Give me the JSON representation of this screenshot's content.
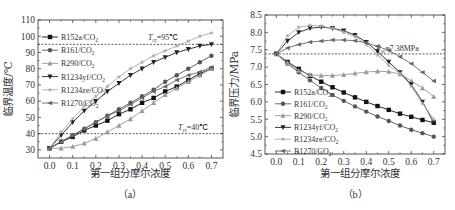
{
  "chart_data": [
    {
      "id": "a",
      "type": "line",
      "caption": "（a）",
      "title": "",
      "xlabel": "第一组分摩尔浓度",
      "ylabel": "临界温度/℃",
      "xlim": [
        -0.05,
        0.75
      ],
      "ylim": [
        25,
        110
      ],
      "xticks": [
        "0.0",
        "0.1",
        "0.2",
        "0.3",
        "0.4",
        "0.5",
        "0.6",
        "0.7"
      ],
      "yticks": [
        "30",
        "40",
        "50",
        "60",
        "70",
        "80",
        "90",
        "100",
        "110"
      ],
      "grid": false,
      "legend_position": "upper left",
      "annotations": [
        {
          "text_main": "T",
          "text_sub": "cr",
          "text_rest": "=95℃",
          "y": 95,
          "dashed_line": true
        },
        {
          "text_main": "T",
          "text_sub": "cr",
          "text_rest": "=40℃",
          "y": 40,
          "dashed_line": true
        }
      ],
      "x": [
        0.0,
        0.05,
        0.1,
        0.15,
        0.2,
        0.25,
        0.3,
        0.35,
        0.4,
        0.45,
        0.5,
        0.55,
        0.6,
        0.65,
        0.7
      ],
      "series": [
        {
          "name": "R152a/CO",
          "sub": "2",
          "marker": "square",
          "color": "#111111",
          "values": [
            31,
            35,
            38,
            42,
            45,
            48,
            52,
            55,
            59,
            62,
            66,
            69,
            73,
            77,
            80
          ]
        },
        {
          "name": "R161/CO",
          "sub": "2",
          "marker": "circle",
          "color": "#555555",
          "values": [
            31,
            35,
            39,
            43,
            47,
            51,
            55,
            59,
            63,
            67,
            72,
            76,
            80,
            84,
            88
          ]
        },
        {
          "name": "R290/CO",
          "sub": "2",
          "marker": "triangle-up",
          "color": "#999999",
          "values": [
            31,
            31,
            32,
            34,
            37,
            41,
            45,
            49,
            54,
            59,
            64,
            68,
            72,
            76,
            80
          ]
        },
        {
          "name": "R1234yf/CO",
          "sub": "2",
          "marker": "triangle-down",
          "color": "#222222",
          "values": [
            31,
            39,
            47,
            54,
            60,
            66,
            71,
            76,
            80,
            84,
            87,
            90,
            92,
            94,
            95
          ]
        },
        {
          "name": "R1234ze/CO",
          "sub": "2",
          "marker": "star",
          "color": "#aaaaaa",
          "values": [
            31,
            41,
            49,
            57,
            63,
            69,
            75,
            80,
            84,
            88,
            91,
            94,
            97,
            100,
            102
          ]
        },
        {
          "name": "R1270/CO",
          "sub": "2",
          "marker": "left-triangle",
          "color": "#666666",
          "values": [
            31,
            35,
            39,
            43,
            47,
            51,
            54,
            58,
            62,
            66,
            69,
            73,
            76,
            78,
            81
          ]
        }
      ]
    },
    {
      "id": "b",
      "type": "line",
      "caption": "（b）",
      "title": "",
      "xlabel": "第一组分摩尔浓度",
      "ylabel": "临界压力/MPa",
      "xlim": [
        -0.05,
        0.75
      ],
      "ylim": [
        4.5,
        8.5
      ],
      "xticks": [
        "0.0",
        "0.1",
        "0.2",
        "0.3",
        "0.4",
        "0.5",
        "0.6",
        "0.7"
      ],
      "yticks": [
        "4.5",
        "5.0",
        "5.5",
        "6.0",
        "6.5",
        "7.0",
        "7.5",
        "8.0",
        "8.5"
      ],
      "grid": false,
      "legend_position": "lower left",
      "annotations": [
        {
          "text_main": "P",
          "text_sub": "cr",
          "text_rest": "=7.38MPa",
          "y": 7.38,
          "dashed_line": true
        }
      ],
      "x": [
        0.0,
        0.05,
        0.1,
        0.15,
        0.2,
        0.25,
        0.3,
        0.35,
        0.4,
        0.45,
        0.5,
        0.55,
        0.6,
        0.65,
        0.7
      ],
      "series": [
        {
          "name": "R152a/CO",
          "sub": "2",
          "marker": "square",
          "color": "#111111",
          "values": [
            7.38,
            7.15,
            6.95,
            6.75,
            6.58,
            6.42,
            6.27,
            6.13,
            6.0,
            5.88,
            5.77,
            5.66,
            5.57,
            5.48,
            5.4
          ]
        },
        {
          "name": "R161/CO",
          "sub": "2",
          "marker": "circle",
          "color": "#555555",
          "values": [
            7.38,
            7.1,
            6.85,
            6.62,
            6.4,
            6.2,
            6.03,
            5.87,
            5.72,
            5.58,
            5.45,
            5.32,
            5.2,
            5.1,
            5.0
          ]
        },
        {
          "name": "R290/CO",
          "sub": "2",
          "marker": "triangle-up",
          "color": "#999999",
          "values": [
            7.38,
            7.12,
            6.9,
            6.78,
            6.76,
            6.76,
            6.78,
            6.82,
            6.86,
            6.88,
            6.87,
            6.8,
            6.6,
            6.4,
            6.15
          ]
        },
        {
          "name": "R1234yf/CO",
          "sub": "2",
          "marker": "triangle-down",
          "color": "#222222",
          "values": [
            7.38,
            7.75,
            8.0,
            8.12,
            8.15,
            8.12,
            8.05,
            7.92,
            7.72,
            7.45,
            7.15,
            6.85,
            6.5,
            6.0,
            5.4
          ]
        },
        {
          "name": "R1234ze/CO",
          "sub": "2",
          "marker": "star",
          "color": "#aaaaaa",
          "values": [
            7.38,
            7.9,
            8.15,
            8.2,
            8.18,
            8.12,
            8.0,
            7.88,
            7.65,
            7.35,
            7.05,
            6.82,
            6.45,
            5.95,
            5.5
          ]
        },
        {
          "name": "R1270/CO",
          "sub": "2",
          "marker": "left-triangle",
          "color": "#666666",
          "values": [
            7.38,
            7.55,
            7.65,
            7.72,
            7.75,
            7.78,
            7.78,
            7.76,
            7.7,
            7.6,
            7.48,
            7.3,
            7.1,
            6.85,
            6.6,
            6.35
          ]
        }
      ]
    }
  ]
}
